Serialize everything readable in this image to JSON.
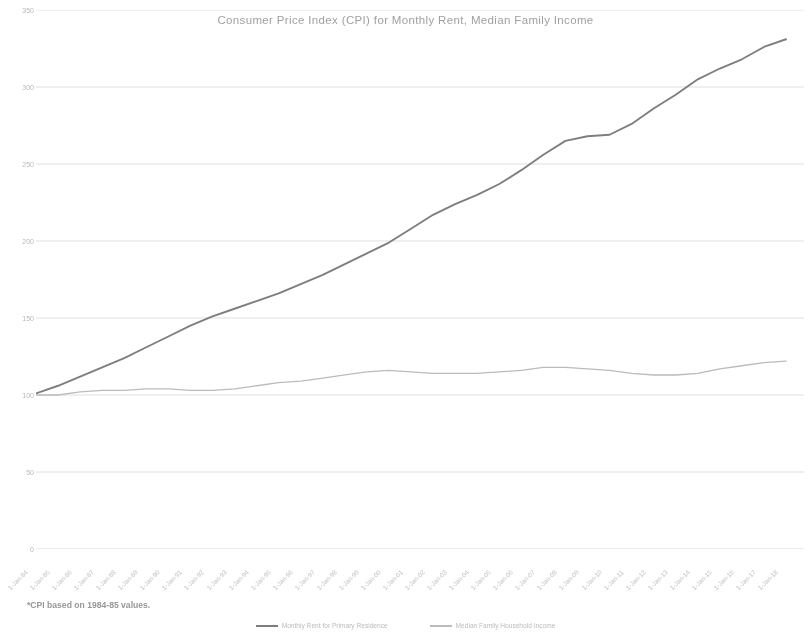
{
  "chart_data": {
    "type": "line",
    "title": "Consumer Price Index (CPI) for Monthly Rent, Median Family Income",
    "xlabel": "",
    "ylabel": "",
    "ylim": [
      0,
      350
    ],
    "ytick_step": 50,
    "yticks": [
      "0",
      "50",
      "100",
      "150",
      "200",
      "250",
      "300",
      "350"
    ],
    "grid": true,
    "grid_axis": "y",
    "legend_position": "bottom",
    "footnote": "*CPI based on 1984-85 values.",
    "categories": [
      "1-Jan-84",
      "1-Jan-85",
      "1-Jan-86",
      "1-Jan-87",
      "1-Jan-88",
      "1-Jan-89",
      "1-Jan-90",
      "1-Jan-91",
      "1-Jan-92",
      "1-Jan-93",
      "1-Jan-94",
      "1-Jan-95",
      "1-Jan-96",
      "1-Jan-97",
      "1-Jan-98",
      "1-Jan-99",
      "1-Jan-00",
      "1-Jan-01",
      "1-Jan-02",
      "1-Jan-03",
      "1-Jan-04",
      "1-Jan-05",
      "1-Jan-06",
      "1-Jan-07",
      "1-Jan-08",
      "1-Jan-09",
      "1-Jan-10",
      "1-Jan-11",
      "1-Jan-12",
      "1-Jan-13",
      "1-Jan-14",
      "1-Jan-15",
      "1-Jan-16",
      "1-Jan-17",
      "1-Jan-18"
    ],
    "series": [
      {
        "name": "Monthly Rent for Primary Residence",
        "color": "#6b6b6b",
        "values": [
          101,
          106,
          112,
          118,
          124,
          131,
          138,
          145,
          151,
          156,
          161,
          166,
          172,
          178,
          185,
          192,
          199,
          208,
          217,
          224,
          230,
          237,
          246,
          256,
          265,
          268,
          269,
          276,
          286,
          295,
          305,
          312,
          318,
          326,
          331
        ]
      },
      {
        "name": "Median Family Household Income",
        "color": "#c4c4c4",
        "values": [
          100,
          100,
          102,
          103,
          103,
          104,
          104,
          103,
          103,
          104,
          106,
          108,
          109,
          111,
          113,
          115,
          116,
          115,
          114,
          114,
          114,
          115,
          116,
          118,
          118,
          117,
          116,
          114,
          113,
          113,
          114,
          117,
          119,
          121,
          122
        ]
      }
    ]
  },
  "legend": {
    "series1_label": "Monthly Rent for Primary Residence",
    "series2_label": "Median Family Household Income"
  },
  "colors": {
    "rent_line": "#6b6b6b",
    "income_line": "#c4c4c4",
    "gridline": "#ededed",
    "axis": "#e3e3e3",
    "title_text": "#9c9c9c"
  }
}
